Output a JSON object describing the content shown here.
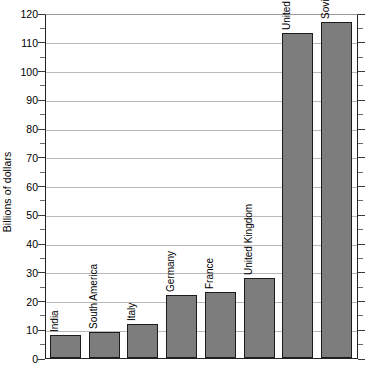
{
  "chart_data": {
    "type": "bar",
    "title": "",
    "xlabel": "",
    "ylabel": "Billions of dollars",
    "ylim": [
      0,
      120
    ],
    "ytick_step": 10,
    "yminor_step": 5,
    "grid": true,
    "legend": null,
    "categories": [
      "India",
      "South America",
      "Italy",
      "Germany",
      "France",
      "United Kingdom",
      "United States",
      "Soviet Union"
    ],
    "values": [
      8,
      9,
      12,
      22,
      23,
      28,
      113,
      117
    ],
    "ytick_labels": [
      "0",
      "10",
      "20",
      "30",
      "40",
      "50",
      "60",
      "70",
      "80",
      "90",
      "100",
      "110",
      "120"
    ],
    "bar_color": "#7d7d7d",
    "bar_edge_color": "#1c1c1c",
    "grid_color": "#b9b9b9",
    "axis_color": "#222222",
    "background_color": "#ffffff"
  }
}
